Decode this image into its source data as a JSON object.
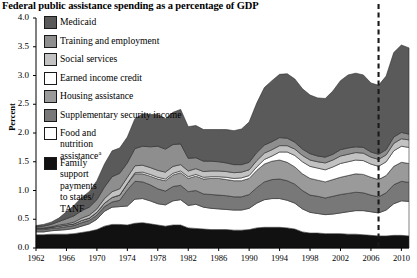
{
  "title": "Federal public assistance spending as a percentage of GDP",
  "axis": {
    "ylabel": "Percent",
    "yticks": [
      "0.0",
      "0.5",
      "1.0",
      "1.5",
      "2.0",
      "2.5",
      "3.0",
      "3.5",
      "4.0"
    ],
    "xticks": [
      "1962",
      "1966",
      "1970",
      "1974",
      "1978",
      "1982",
      "1986",
      "1990",
      "1994",
      "1998",
      "2002",
      "2006",
      "2010"
    ]
  },
  "legend": [
    {
      "label": "Medicaid",
      "color": "#5a5a5a",
      "name": "legend-medicaid"
    },
    {
      "label": "Training and employment",
      "color": "#8e8e8e",
      "name": "legend-training-and-employment"
    },
    {
      "label": "Social services",
      "color": "#c2c2c2",
      "name": "legend-social-services"
    },
    {
      "label": "Earned income credit",
      "color": "#ffffff",
      "name": "legend-earned-income-credit"
    },
    {
      "label": "Housing assistance",
      "color": "#9a9a9a",
      "name": "legend-housing-assistance"
    },
    {
      "label": "Supplementary security income",
      "color": "#787878",
      "name": "legend-supplementary-security-income"
    },
    {
      "label": "Food and nutrition assistance",
      "superscript": "a",
      "color": "#ffffff",
      "name": "legend-food-and-nutrition-assistance"
    },
    {
      "label": "Family support payments to states/ TANF",
      "color": "#111111",
      "name": "legend-family-support-payments"
    }
  ],
  "projection_marker": {
    "year": 2007,
    "style": "dashed",
    "color": "#1a1a1a"
  },
  "chart_data": {
    "type": "area",
    "title": "Federal public assistance spending as a percentage of GDP",
    "xlabel": "",
    "ylabel": "Percent",
    "xlim": [
      1962,
      2011
    ],
    "ylim": [
      0.0,
      4.0
    ],
    "grid": false,
    "legend_position": "upper-left",
    "stacked": true,
    "stack_order_bottom_to_top": [
      "Family support payments to states/TANF",
      "Food and nutrition assistance",
      "Supplementary security income",
      "Housing assistance",
      "Earned income credit",
      "Social services",
      "Training and employment",
      "Medicaid"
    ],
    "x": [
      1962,
      1963,
      1964,
      1965,
      1966,
      1967,
      1968,
      1969,
      1970,
      1971,
      1972,
      1973,
      1974,
      1975,
      1976,
      1977,
      1978,
      1979,
      1980,
      1981,
      1982,
      1983,
      1984,
      1985,
      1986,
      1987,
      1988,
      1989,
      1990,
      1991,
      1992,
      1993,
      1994,
      1995,
      1996,
      1997,
      1998,
      1999,
      2000,
      2001,
      2002,
      2003,
      2004,
      2005,
      2006,
      2007,
      2008,
      2009,
      2010,
      2011
    ],
    "series": [
      {
        "name": "Family support payments to states/TANF",
        "color": "#111111",
        "values": [
          0.23,
          0.23,
          0.24,
          0.24,
          0.24,
          0.25,
          0.27,
          0.29,
          0.32,
          0.38,
          0.41,
          0.41,
          0.4,
          0.43,
          0.44,
          0.42,
          0.4,
          0.38,
          0.4,
          0.4,
          0.35,
          0.34,
          0.33,
          0.32,
          0.32,
          0.32,
          0.31,
          0.31,
          0.32,
          0.35,
          0.36,
          0.36,
          0.36,
          0.35,
          0.33,
          0.28,
          0.26,
          0.26,
          0.25,
          0.25,
          0.25,
          0.24,
          0.24,
          0.23,
          0.22,
          0.21,
          0.21,
          0.22,
          0.22,
          0.21
        ]
      },
      {
        "name": "Food and nutrition assistance",
        "color": "#ffffff",
        "values": [
          0.05,
          0.05,
          0.06,
          0.07,
          0.08,
          0.09,
          0.11,
          0.13,
          0.18,
          0.26,
          0.3,
          0.31,
          0.33,
          0.42,
          0.42,
          0.4,
          0.37,
          0.37,
          0.42,
          0.44,
          0.39,
          0.42,
          0.38,
          0.37,
          0.36,
          0.35,
          0.35,
          0.35,
          0.37,
          0.43,
          0.48,
          0.5,
          0.5,
          0.48,
          0.45,
          0.4,
          0.36,
          0.34,
          0.33,
          0.34,
          0.36,
          0.39,
          0.41,
          0.42,
          0.41,
          0.4,
          0.45,
          0.55,
          0.6,
          0.6
        ]
      },
      {
        "name": "Supplementary security income",
        "color": "#787878",
        "values": [
          0.04,
          0.04,
          0.04,
          0.04,
          0.05,
          0.05,
          0.06,
          0.06,
          0.07,
          0.08,
          0.09,
          0.11,
          0.28,
          0.31,
          0.29,
          0.28,
          0.26,
          0.24,
          0.25,
          0.25,
          0.24,
          0.24,
          0.23,
          0.24,
          0.24,
          0.24,
          0.23,
          0.23,
          0.24,
          0.27,
          0.31,
          0.33,
          0.34,
          0.34,
          0.33,
          0.32,
          0.3,
          0.3,
          0.29,
          0.31,
          0.32,
          0.32,
          0.32,
          0.31,
          0.29,
          0.28,
          0.3,
          0.33,
          0.34,
          0.33
        ]
      },
      {
        "name": "Housing assistance",
        "color": "#9a9a9a",
        "values": [
          0.02,
          0.02,
          0.02,
          0.03,
          0.03,
          0.03,
          0.04,
          0.04,
          0.05,
          0.06,
          0.08,
          0.09,
          0.11,
          0.13,
          0.14,
          0.15,
          0.17,
          0.18,
          0.2,
          0.22,
          0.23,
          0.25,
          0.26,
          0.28,
          0.29,
          0.28,
          0.28,
          0.28,
          0.28,
          0.3,
          0.31,
          0.32,
          0.33,
          0.32,
          0.3,
          0.29,
          0.29,
          0.28,
          0.28,
          0.29,
          0.3,
          0.31,
          0.32,
          0.32,
          0.31,
          0.3,
          0.3,
          0.32,
          0.33,
          0.33
        ]
      },
      {
        "name": "Earned income credit",
        "color": "#ffffff",
        "values": [
          0.0,
          0.0,
          0.0,
          0.0,
          0.0,
          0.0,
          0.0,
          0.0,
          0.0,
          0.0,
          0.0,
          0.0,
          0.0,
          0.02,
          0.03,
          0.03,
          0.03,
          0.03,
          0.03,
          0.03,
          0.03,
          0.03,
          0.03,
          0.03,
          0.03,
          0.04,
          0.04,
          0.05,
          0.05,
          0.06,
          0.08,
          0.09,
          0.14,
          0.18,
          0.2,
          0.21,
          0.21,
          0.21,
          0.21,
          0.22,
          0.24,
          0.24,
          0.24,
          0.24,
          0.23,
          0.23,
          0.24,
          0.27,
          0.28,
          0.28
        ]
      },
      {
        "name": "Social services",
        "color": "#c2c2c2",
        "values": [
          0.01,
          0.01,
          0.01,
          0.02,
          0.02,
          0.03,
          0.04,
          0.05,
          0.06,
          0.08,
          0.1,
          0.11,
          0.11,
          0.12,
          0.12,
          0.12,
          0.12,
          0.12,
          0.12,
          0.11,
          0.1,
          0.1,
          0.1,
          0.1,
          0.1,
          0.1,
          0.1,
          0.1,
          0.1,
          0.11,
          0.11,
          0.11,
          0.11,
          0.11,
          0.11,
          0.11,
          0.11,
          0.11,
          0.12,
          0.12,
          0.13,
          0.13,
          0.13,
          0.13,
          0.12,
          0.12,
          0.12,
          0.13,
          0.13,
          0.13
        ]
      },
      {
        "name": "Training and employment",
        "color": "#8e8e8e",
        "values": [
          0.02,
          0.03,
          0.04,
          0.06,
          0.09,
          0.11,
          0.13,
          0.14,
          0.16,
          0.2,
          0.26,
          0.27,
          0.25,
          0.3,
          0.33,
          0.36,
          0.42,
          0.4,
          0.38,
          0.36,
          0.22,
          0.19,
          0.18,
          0.17,
          0.16,
          0.15,
          0.14,
          0.13,
          0.13,
          0.14,
          0.14,
          0.14,
          0.14,
          0.13,
          0.12,
          0.11,
          0.11,
          0.1,
          0.1,
          0.1,
          0.11,
          0.11,
          0.1,
          0.1,
          0.09,
          0.09,
          0.09,
          0.11,
          0.11,
          0.1
        ]
      },
      {
        "name": "Medicaid",
        "color": "#5a5a5a",
        "values": [
          0.02,
          0.03,
          0.04,
          0.06,
          0.12,
          0.18,
          0.23,
          0.27,
          0.33,
          0.4,
          0.45,
          0.44,
          0.45,
          0.52,
          0.56,
          0.56,
          0.55,
          0.53,
          0.56,
          0.6,
          0.55,
          0.56,
          0.55,
          0.55,
          0.56,
          0.58,
          0.59,
          0.62,
          0.7,
          0.86,
          1.0,
          1.06,
          1.1,
          1.12,
          1.1,
          1.05,
          1.02,
          1.01,
          1.02,
          1.1,
          1.2,
          1.27,
          1.28,
          1.26,
          1.2,
          1.2,
          1.28,
          1.47,
          1.52,
          1.5
        ]
      }
    ],
    "annotations": [
      {
        "type": "vline",
        "x": 2007,
        "style": "dashed",
        "note": "projection boundary"
      }
    ]
  }
}
